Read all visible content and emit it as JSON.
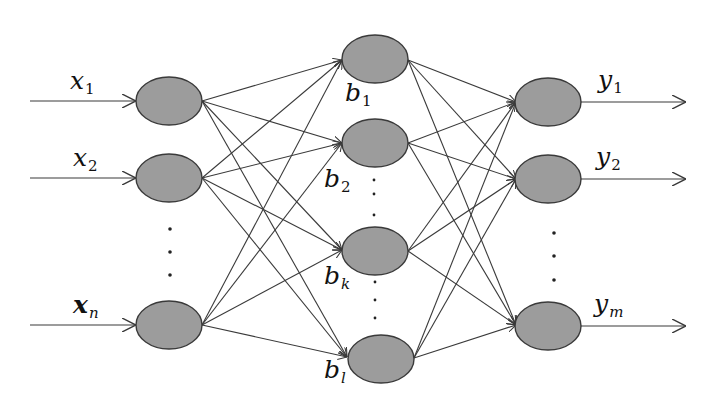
{
  "diagram": {
    "title": "",
    "type": "neural-network",
    "colors": {
      "node_fill": "#9c9c9c",
      "node_stroke": "#3a3a3a",
      "edge": "#3a3a3a",
      "background": "#ffffff"
    },
    "layers": [
      {
        "name": "input",
        "nodes": [
          {
            "id": "x1",
            "label": "x",
            "sub": "1"
          },
          {
            "id": "x2",
            "label": "x",
            "sub": "2"
          },
          {
            "id": "xn",
            "label": "x",
            "sub": "n"
          }
        ],
        "ellipsis": "⋮"
      },
      {
        "name": "hidden",
        "nodes": [
          {
            "id": "b1",
            "label": "b",
            "sub": "1"
          },
          {
            "id": "b2",
            "label": "b",
            "sub": "2"
          },
          {
            "id": "bk",
            "label": "b",
            "sub": "k"
          },
          {
            "id": "bl",
            "label": "b",
            "sub": "l"
          }
        ],
        "ellipsis": "⋮"
      },
      {
        "name": "output",
        "nodes": [
          {
            "id": "y1",
            "label": "y",
            "sub": "1"
          },
          {
            "id": "y2",
            "label": "y",
            "sub": "2"
          },
          {
            "id": "ym",
            "label": "y",
            "sub": "m"
          }
        ],
        "ellipsis": "⋮"
      }
    ],
    "connections": "fully-connected between adjacent layers (input→hidden, hidden→output); input arrows enter input nodes; output arrows leave output nodes"
  }
}
